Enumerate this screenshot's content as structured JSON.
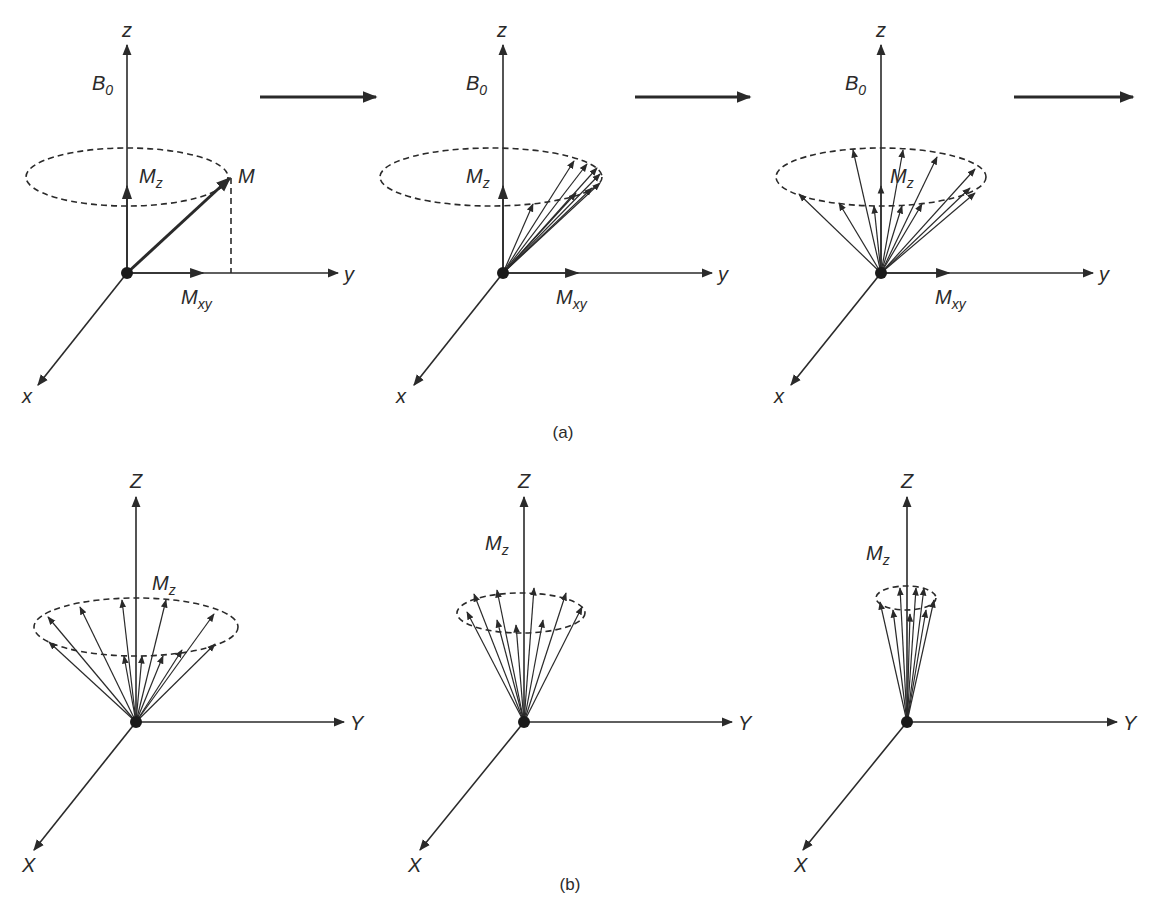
{
  "figure": {
    "part_a": {
      "caption": "(a)",
      "panels": [
        {
          "z": "z",
          "y": "y",
          "x": "x",
          "b0": "B",
          "b0_sub": "0",
          "mz": "M",
          "mz_sub": "z",
          "mxy": "M",
          "mxy_sub": "xy",
          "m": "M"
        },
        {
          "z": "z",
          "y": "y",
          "x": "x",
          "b0": "B",
          "b0_sub": "0",
          "mz": "M",
          "mz_sub": "z",
          "mxy": "M",
          "mxy_sub": "xy"
        },
        {
          "z": "z",
          "y": "y",
          "x": "x",
          "b0": "B",
          "b0_sub": "0",
          "mz": "M",
          "mz_sub": "z",
          "mxy": "M",
          "mxy_sub": "xy"
        }
      ],
      "transition_arrows": 3
    },
    "part_b": {
      "caption": "(b)",
      "panels": [
        {
          "z": "Z",
          "y": "Y",
          "x": "X",
          "mz": "M",
          "mz_sub": "z"
        },
        {
          "z": "Z",
          "y": "Y",
          "x": "X",
          "mz": "M",
          "mz_sub": "z"
        },
        {
          "z": "Z",
          "y": "Y",
          "x": "X",
          "mz": "M",
          "mz_sub": "z"
        }
      ]
    }
  }
}
